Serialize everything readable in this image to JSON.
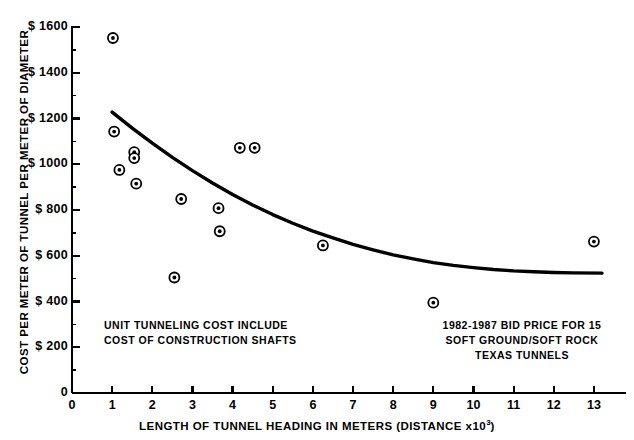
{
  "chart_data": {
    "type": "scatter",
    "title": "",
    "xlabel": "LENGTH OF TUNNEL HEADING IN METERS (DISTANCE x10",
    "xlabel_sup": "3",
    "xlabel_tail": ")",
    "ylabel": "COST PER METER OF TUNNEL PER METER OF DIAMETER",
    "xlim": [
      0,
      13.6
    ],
    "ylim": [
      0,
      1680
    ],
    "grid": false,
    "legend": "none",
    "xticks": [
      0,
      1,
      2,
      3,
      4,
      5,
      6,
      7,
      8,
      9,
      10,
      11,
      12,
      13
    ],
    "xtick_labels": [
      "0",
      "1",
      "2",
      "3",
      "4",
      "5",
      "6",
      "7",
      "8",
      "9",
      "10",
      "11",
      "12",
      "13"
    ],
    "yticks": [
      0,
      200,
      400,
      600,
      800,
      1000,
      1200,
      1400,
      1600
    ],
    "ytick_labels": [
      "0",
      "$ 200",
      "$ 400",
      "$ 600",
      "$ 800",
      "$ 1000",
      "$ 1200",
      "$ 1400",
      "$ 1600"
    ],
    "marker_style": "bullseye-open-circle-with-dot",
    "point_count": 17,
    "points": [
      {
        "x": 1.02,
        "y": 1552
      },
      {
        "x": 1.05,
        "y": 1143
      },
      {
        "x": 1.18,
        "y": 975
      },
      {
        "x": 1.55,
        "y": 1053
      },
      {
        "x": 1.55,
        "y": 1027
      },
      {
        "x": 1.6,
        "y": 915
      },
      {
        "x": 2.55,
        "y": 505
      },
      {
        "x": 2.72,
        "y": 848
      },
      {
        "x": 3.65,
        "y": 808
      },
      {
        "x": 3.68,
        "y": 707
      },
      {
        "x": 4.18,
        "y": 1072
      },
      {
        "x": 4.55,
        "y": 1072
      },
      {
        "x": 6.25,
        "y": 645
      },
      {
        "x": 9.0,
        "y": 395
      },
      {
        "x": 13.0,
        "y": 662
      }
    ],
    "fit_curve": {
      "name": "cost trend curve",
      "style": "solid thick black",
      "points": [
        {
          "x": 1.0,
          "y": 1228
        },
        {
          "x": 1.5,
          "y": 1158
        },
        {
          "x": 2.0,
          "y": 1092
        },
        {
          "x": 2.5,
          "y": 1030
        },
        {
          "x": 3.0,
          "y": 972
        },
        {
          "x": 3.5,
          "y": 918
        },
        {
          "x": 4.0,
          "y": 868
        },
        {
          "x": 4.5,
          "y": 822
        },
        {
          "x": 5.0,
          "y": 780
        },
        {
          "x": 5.5,
          "y": 742
        },
        {
          "x": 6.0,
          "y": 708
        },
        {
          "x": 6.5,
          "y": 678
        },
        {
          "x": 7.0,
          "y": 650
        },
        {
          "x": 7.5,
          "y": 626
        },
        {
          "x": 8.0,
          "y": 604
        },
        {
          "x": 8.5,
          "y": 586
        },
        {
          "x": 9.0,
          "y": 570
        },
        {
          "x": 9.5,
          "y": 558
        },
        {
          "x": 10.0,
          "y": 548
        },
        {
          "x": 10.5,
          "y": 540
        },
        {
          "x": 11.0,
          "y": 534
        },
        {
          "x": 11.5,
          "y": 530
        },
        {
          "x": 12.0,
          "y": 527
        },
        {
          "x": 12.5,
          "y": 525
        },
        {
          "x": 13.2,
          "y": 524
        }
      ]
    },
    "annotations": [
      {
        "id": "left",
        "lines": [
          "UNIT TUNNELING COST INCLUDE",
          "COST OF CONSTRUCTION SHAFTS"
        ]
      },
      {
        "id": "right",
        "lines": [
          "1982-1987 BID PRICE FOR 15",
          "SOFT GROUND/SOFT ROCK",
          "TEXAS TUNNELS"
        ]
      }
    ],
    "colors": {
      "ink": "#000000",
      "background": "#ffffff"
    }
  }
}
